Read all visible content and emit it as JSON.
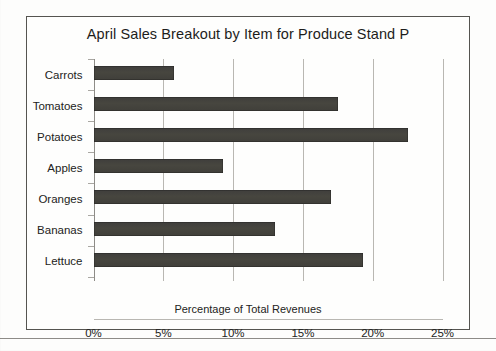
{
  "chart_data": {
    "type": "bar",
    "orientation": "horizontal",
    "title": "April Sales Breakout by Item for Produce Stand P",
    "xlabel": "Percentage of Total Revenues",
    "ylabel": "",
    "categories": [
      "Carrots",
      "Tomatoes",
      "Potatoes",
      "Apples",
      "Oranges",
      "Bananas",
      "Lettuce"
    ],
    "values": [
      5.8,
      17.5,
      22.5,
      9.3,
      17.0,
      13.0,
      19.3
    ],
    "xlim": [
      0,
      25
    ],
    "xtick_values": [
      0,
      5,
      10,
      15,
      20,
      25
    ],
    "xtick_labels": [
      "0%",
      "5%",
      "10%",
      "15%",
      "20%",
      "25%"
    ],
    "grid": "vertical",
    "legend": "none",
    "bar_color": "#47463f",
    "gridline_color": "#b9b7b2",
    "frame_color": "#555450",
    "text_color": "#232321"
  }
}
